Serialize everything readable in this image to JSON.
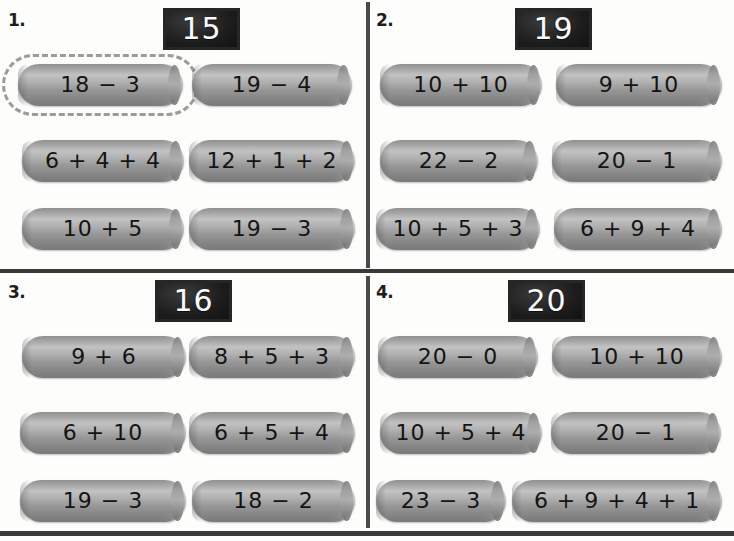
{
  "worksheet": {
    "background_color": "#fdfdfb",
    "rod_color": "#a0a0a0",
    "plaque_color": "#1d1d1d",
    "selection_color": "#9b9b9b"
  },
  "problems": [
    {
      "number": "1.",
      "target": "15",
      "rows": [
        [
          {
            "label": "18 − 3",
            "selected": true,
            "left": 18,
            "width": 165
          },
          {
            "label": "19 − 4",
            "selected": false,
            "left": 192,
            "width": 160
          }
        ],
        [
          {
            "label": "6 + 4 + 4",
            "selected": false,
            "left": 22,
            "width": 162
          },
          {
            "label": "12 + 1 + 2",
            "selected": false,
            "left": 189,
            "width": 166
          }
        ],
        [
          {
            "label": "10 + 5",
            "selected": false,
            "left": 22,
            "width": 162
          },
          {
            "label": "19 − 3",
            "selected": false,
            "left": 189,
            "width": 166
          }
        ]
      ]
    },
    {
      "number": "2.",
      "target": "19",
      "rows": [
        [
          {
            "label": "10 + 10",
            "selected": false,
            "left": 12,
            "width": 162
          },
          {
            "label": "9 + 10",
            "selected": false,
            "left": 188,
            "width": 166
          }
        ],
        [
          {
            "label": "22 − 2",
            "selected": false,
            "left": 12,
            "width": 158
          },
          {
            "label": "20 − 1",
            "selected": false,
            "left": 184,
            "width": 170
          }
        ],
        [
          {
            "label": "10 + 5 + 3",
            "selected": false,
            "left": 8,
            "width": 164
          },
          {
            "label": "6 + 9 + 4",
            "selected": false,
            "left": 186,
            "width": 168
          }
        ]
      ]
    },
    {
      "number": "3.",
      "target": "16",
      "rows": [
        [
          {
            "label": "9 + 6",
            "selected": false,
            "left": 22,
            "width": 164
          },
          {
            "label": "8 + 5 + 3",
            "selected": false,
            "left": 189,
            "width": 166
          }
        ],
        [
          {
            "label": "6 + 10",
            "selected": false,
            "left": 20,
            "width": 166
          },
          {
            "label": "6 + 5 + 4",
            "selected": false,
            "left": 189,
            "width": 166
          }
        ],
        [
          {
            "label": "19 − 3",
            "selected": false,
            "left": 20,
            "width": 166
          },
          {
            "label": "18 − 2",
            "selected": false,
            "left": 192,
            "width": 163
          }
        ]
      ]
    },
    {
      "number": "4.",
      "target": "20",
      "rows": [
        [
          {
            "label": "20 − 0",
            "selected": false,
            "left": 10,
            "width": 160
          },
          {
            "label": "10 + 10",
            "selected": false,
            "left": 184,
            "width": 170
          }
        ],
        [
          {
            "label": "10 + 5 + 4",
            "selected": false,
            "left": 12,
            "width": 162
          },
          {
            "label": "20 − 1",
            "selected": false,
            "left": 183,
            "width": 170
          }
        ],
        [
          {
            "label": "23 − 3",
            "selected": false,
            "left": 8,
            "width": 130
          },
          {
            "label": "6 + 9 + 4 + 1",
            "selected": false,
            "left": 144,
            "width": 210
          }
        ]
      ]
    }
  ]
}
